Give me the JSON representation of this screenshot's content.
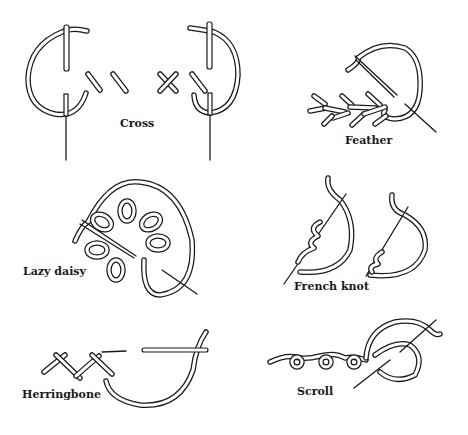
{
  "figure": {
    "background": "#ffffff",
    "ink_color": "#1a1a1a"
  },
  "stitches": [
    {
      "id": "cross",
      "label": "Cross",
      "label_pos": [
        120,
        124
      ]
    },
    {
      "id": "feather",
      "label": "Feather",
      "label_pos": [
        345,
        141
      ]
    },
    {
      "id": "lazy-daisy",
      "label": "Lazy daisy",
      "label_pos": [
        23,
        272
      ]
    },
    {
      "id": "french-knot",
      "label": "French knot",
      "label_pos": [
        294,
        287
      ]
    },
    {
      "id": "herringbone",
      "label": "Herringbone",
      "label_pos": [
        22,
        395
      ]
    },
    {
      "id": "scroll",
      "label": "Scroll",
      "label_pos": [
        297,
        392
      ]
    }
  ]
}
